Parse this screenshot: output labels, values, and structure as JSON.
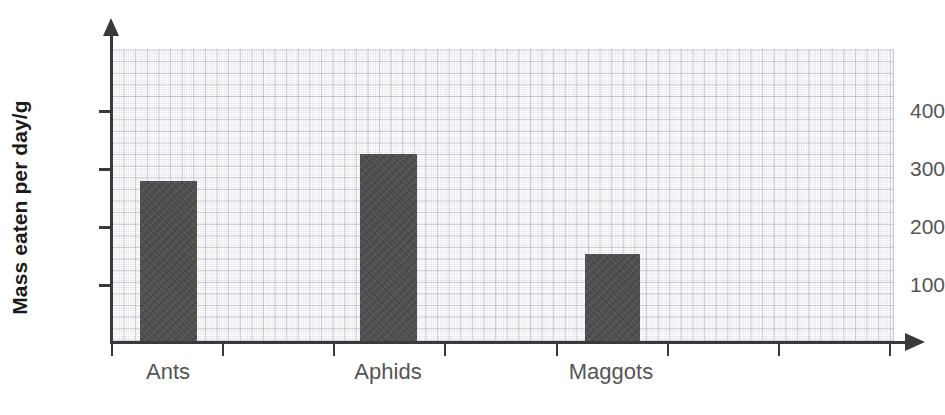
{
  "chart_data": {
    "type": "bar",
    "title": "",
    "xlabel": "",
    "ylabel": "Mass eaten per day/g",
    "categories": [
      "Ants",
      "Aphids",
      "Maggots"
    ],
    "values": [
      275,
      320,
      150
    ],
    "series": [
      {
        "name": "Mass eaten per day",
        "values": [
          275,
          320,
          150
        ]
      }
    ],
    "ylim": [
      0,
      500
    ],
    "y_ticks": [
      100,
      200,
      300,
      400
    ],
    "y_tick_labels": [
      "100",
      "200",
      "300",
      "400"
    ],
    "y_major_interval": 100,
    "grid": true,
    "grid_style": "fine graph paper, minor and major squares",
    "legend": "none",
    "bar_color": "#4d4d4d",
    "axis_color": "#3a3a3a",
    "tick_label_color": "#555555",
    "axis_title_color": "#1a1a1a",
    "grid_color": "#7878964d",
    "axis_arrows": [
      "y-up",
      "x-right"
    ],
    "bars": [
      {
        "category": "Ants",
        "value": 275,
        "value_label": ""
      },
      {
        "category": "Aphids",
        "value": 320,
        "value_label": ""
      },
      {
        "category": "Maggots",
        "value": 150,
        "value_label": ""
      }
    ]
  },
  "axes": {
    "y_title": "Mass eaten per day/g",
    "y_tick_labels": [
      "400",
      "300",
      "200",
      "100"
    ],
    "x_tick_count": 8
  }
}
